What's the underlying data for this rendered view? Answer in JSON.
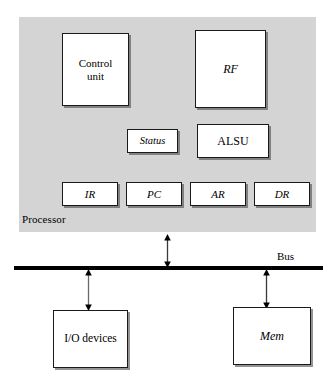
{
  "diagram": {
    "colors": {
      "processor_fill": "#d4d4d4",
      "box_fill": "#ffffff",
      "stroke": "#1a1a1a",
      "bus": "#000000"
    },
    "processor": {
      "caption": "Processor",
      "blocks": [
        {
          "id": "control-unit",
          "label": "Control\nunit",
          "line1": "Control",
          "line2": "unit",
          "style": "upright"
        },
        {
          "id": "rf",
          "label": "RF",
          "style": "italic"
        },
        {
          "id": "status",
          "label": "Status",
          "style": "italic"
        },
        {
          "id": "alsu",
          "label": "ALSU",
          "style": "upright"
        },
        {
          "id": "ir",
          "label": "IR",
          "style": "italic"
        },
        {
          "id": "pc",
          "label": "PC",
          "style": "italic"
        },
        {
          "id": "ar",
          "label": "AR",
          "style": "italic"
        },
        {
          "id": "dr",
          "label": "DR",
          "style": "italic"
        }
      ]
    },
    "bus": {
      "caption": "Bus"
    },
    "peripherals": [
      {
        "id": "io-devices",
        "label": "I/O devices",
        "style": "upright"
      },
      {
        "id": "mem",
        "label": "Mem",
        "style": "italic"
      }
    ],
    "connectors": [
      {
        "id": "processor-bus",
        "from": "Processor",
        "to": "Bus",
        "kind": "double-headed-arrow"
      },
      {
        "id": "io-bus",
        "from": "Bus",
        "to": "I/O devices",
        "kind": "double-headed-arrow"
      },
      {
        "id": "mem-bus",
        "from": "Bus",
        "to": "Mem",
        "kind": "double-headed-arrow"
      }
    ]
  }
}
